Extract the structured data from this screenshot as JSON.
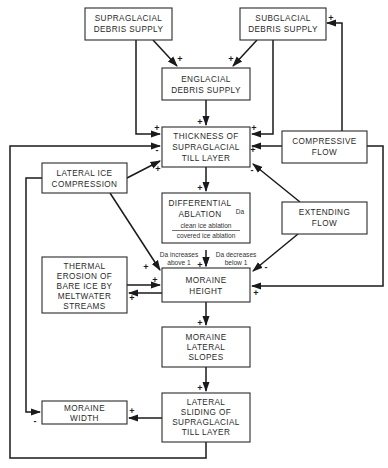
{
  "diagram": {
    "boxes": {
      "supraglacial": {
        "lines": [
          "SUPRAGLACIAL",
          "DEBRIS SUPPLY"
        ]
      },
      "subglacial": {
        "lines": [
          "SUBGLACIAL",
          "DEBRIS SUPPLY"
        ]
      },
      "englacial": {
        "lines": [
          "ENGLACIAL",
          "DEBRIS SUPPLY"
        ]
      },
      "thickness": {
        "lines": [
          "THICKNESS OF",
          "SUPRAGLACIAL",
          "TILL LAYER"
        ]
      },
      "compressive": {
        "lines": [
          "COMPRESSIVE",
          "FLOW"
        ]
      },
      "lateral_ice": {
        "lines": [
          "LATERAL ICE",
          "COMPRESSION"
        ]
      },
      "differential": {
        "lines": [
          "DIFFERENTIAL",
          "ABLATION"
        ],
        "symbol": "Da",
        "numerator": "clean ice ablation",
        "denominator": "covered ice ablation"
      },
      "extending": {
        "lines": [
          "EXTENDING",
          "FLOW"
        ]
      },
      "thermal": {
        "lines": [
          "THERMAL",
          "EROSION OF",
          "BARE ICE BY",
          "MELTWATER",
          "STREAMS"
        ]
      },
      "moraine_height": {
        "lines": [
          "MORAINE",
          "HEIGHT"
        ]
      },
      "moraine_slopes": {
        "lines": [
          "MORAINE",
          "LATERAL",
          "SLOPES"
        ]
      },
      "moraine_width": {
        "lines": [
          "MORAINE",
          "WIDTH"
        ]
      },
      "lateral_sliding": {
        "lines": [
          "LATERAL",
          "SLIDING OF",
          "SUPRAGLACIAL",
          "TILL LAYER"
        ]
      }
    },
    "annotations": {
      "da_increases": [
        "Da increases",
        "above 1"
      ],
      "da_decreases": [
        "Da decreases",
        "below 1"
      ]
    },
    "signs": {
      "supra_to_engl": "+",
      "sub_to_engl": "+",
      "sub_feedback": "+",
      "engl_to_thick": "+",
      "supra_to_thick": "+",
      "loop_to_thick": "-",
      "latice_to_thick": "+",
      "comp_to_thick_top": "+",
      "comp_to_thick": "+",
      "ext_to_thick": "-",
      "thick_to_diff": "+",
      "diff_to_height": "+",
      "latice_to_height": "+",
      "thermal_to_height": "+",
      "height_to_thermal": "+",
      "ext_to_height": "-",
      "comp_to_height": "+",
      "height_to_slopes": "+",
      "slopes_to_sliding": "+",
      "sliding_to_width": "+",
      "latice_to_width": "-"
    },
    "edges": [
      {
        "from": "SUPRAGLACIAL DEBRIS SUPPLY",
        "to": "ENGLACIAL DEBRIS SUPPLY",
        "sign": "+"
      },
      {
        "from": "SUBGLACIAL DEBRIS SUPPLY",
        "to": "ENGLACIAL DEBRIS SUPPLY",
        "sign": "+"
      },
      {
        "from": "SUPRAGLACIAL DEBRIS SUPPLY",
        "to": "THICKNESS OF SUPRAGLACIAL TILL LAYER",
        "sign": "+"
      },
      {
        "from": "SUBGLACIAL DEBRIS SUPPLY",
        "to": "THICKNESS OF SUPRAGLACIAL TILL LAYER",
        "sign": "+"
      },
      {
        "from": "ENGLACIAL DEBRIS SUPPLY",
        "to": "THICKNESS OF SUPRAGLACIAL TILL LAYER",
        "sign": "+"
      },
      {
        "from": "COMPRESSIVE FLOW",
        "to": "THICKNESS OF SUPRAGLACIAL TILL LAYER",
        "sign": "+"
      },
      {
        "from": "COMPRESSIVE FLOW",
        "to": "SUBGLACIAL DEBRIS SUPPLY",
        "sign": "+"
      },
      {
        "from": "COMPRESSIVE FLOW",
        "to": "MORAINE HEIGHT",
        "sign": "+"
      },
      {
        "from": "LATERAL ICE COMPRESSION",
        "to": "THICKNESS OF SUPRAGLACIAL TILL LAYER",
        "sign": "+"
      },
      {
        "from": "LATERAL ICE COMPRESSION",
        "to": "MORAINE HEIGHT",
        "sign": "+"
      },
      {
        "from": "LATERAL ICE COMPRESSION",
        "to": "MORAINE WIDTH",
        "sign": "-"
      },
      {
        "from": "EXTENDING FLOW",
        "to": "THICKNESS OF SUPRAGLACIAL TILL LAYER",
        "sign": "-"
      },
      {
        "from": "EXTENDING FLOW",
        "to": "MORAINE HEIGHT",
        "sign": "-"
      },
      {
        "from": "THICKNESS OF SUPRAGLACIAL TILL LAYER",
        "to": "DIFFERENTIAL ABLATION",
        "sign": "+"
      },
      {
        "from": "DIFFERENTIAL ABLATION",
        "to": "MORAINE HEIGHT",
        "sign": "+"
      },
      {
        "from": "THERMAL EROSION OF BARE ICE BY MELTWATER STREAMS",
        "to": "MORAINE HEIGHT",
        "sign": "+"
      },
      {
        "from": "MORAINE HEIGHT",
        "to": "THERMAL EROSION OF BARE ICE BY MELTWATER STREAMS",
        "sign": "+"
      },
      {
        "from": "MORAINE HEIGHT",
        "to": "MORAINE LATERAL SLOPES",
        "sign": "+"
      },
      {
        "from": "MORAINE LATERAL SLOPES",
        "to": "LATERAL SLIDING OF SUPRAGLACIAL TILL LAYER",
        "sign": "+"
      },
      {
        "from": "LATERAL SLIDING OF SUPRAGLACIAL TILL LAYER",
        "to": "MORAINE WIDTH",
        "sign": "+"
      },
      {
        "from": "LATERAL SLIDING OF SUPRAGLACIAL TILL LAYER",
        "to": "THICKNESS OF SUPRAGLACIAL TILL LAYER",
        "sign": "-"
      }
    ]
  }
}
